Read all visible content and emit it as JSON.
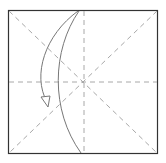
{
  "diagram": {
    "type": "origami-step",
    "paper": {
      "x": 8,
      "y": 10,
      "w": 149,
      "h": 144,
      "stroke": "#333333"
    },
    "crease_color": "#a0a0a0",
    "fold_color": "#666666",
    "creases": [
      "horizontal-center",
      "vertical-center",
      "diagonal-tl-br",
      "diagonal-tr-bl",
      "diagonal-left-top-half",
      "diagonal-left-bottom-half"
    ],
    "fold_line": "curved valley from top-center to bottom-center",
    "arrow": "fold direction arrow, top-center curving down to left"
  }
}
